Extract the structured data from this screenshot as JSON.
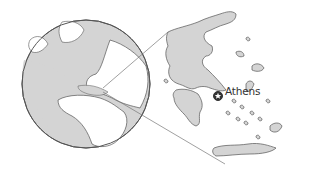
{
  "map": {
    "type": "locator-map",
    "globe": {
      "region_highlighted": "Greece",
      "land_color": "#d4d4d4",
      "ocean_color": "#ffffff"
    },
    "inset": {
      "country": "Greece",
      "land_color": "#d4d4d4"
    },
    "cities": [
      {
        "name": "Athens",
        "marker": "capital-star-icon"
      }
    ],
    "colors": {
      "outline": "#555555",
      "land": "#d4d4d4",
      "background": "#ffffff"
    }
  }
}
